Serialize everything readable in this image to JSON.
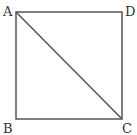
{
  "diagram": {
    "shape": "square",
    "vertices": {
      "A": {
        "label": "A",
        "x": 16,
        "y": 12,
        "lx": 3,
        "ly": 16
      },
      "D": {
        "label": "D",
        "x": 122,
        "y": 12,
        "lx": 125,
        "ly": 16
      },
      "B": {
        "label": "B",
        "x": 16,
        "y": 119,
        "lx": 3,
        "ly": 133
      },
      "C": {
        "label": "C",
        "x": 122,
        "y": 119,
        "lx": 122,
        "ly": 133
      }
    },
    "diagonal": [
      "A",
      "C"
    ],
    "stroke_color": "#555555"
  }
}
